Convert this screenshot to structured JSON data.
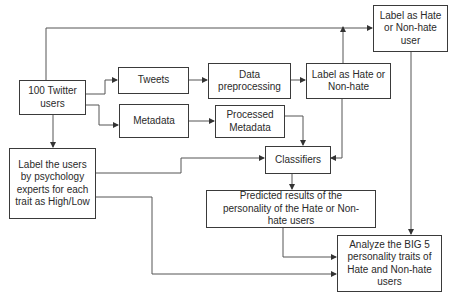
{
  "diagram": {
    "type": "flowchart",
    "nodes": {
      "twitter_users": "100 Twitter users",
      "tweets": "Tweets",
      "metadata": "Metadata",
      "data_preprocessing": "Data preprocessing",
      "processed_metadata": "Processed Metadata",
      "label_hate": "Label as Hate or Non-hate",
      "label_hate_user": "Label as Hate or Non-hate user",
      "psych_label": "Label the users by psychology experts for each trait as High/Low",
      "classifiers": "Classifiers",
      "predicted_results": "Predicted results of the personality of the Hate or Non-hate users",
      "analyze_big5": "Analyze the BIG 5 personality traits of Hate and Non-hate users"
    },
    "edges": [
      {
        "from": "twitter_users",
        "to": "tweets"
      },
      {
        "from": "twitter_users",
        "to": "metadata"
      },
      {
        "from": "twitter_users",
        "to": "label_hate_user"
      },
      {
        "from": "twitter_users",
        "to": "psych_label"
      },
      {
        "from": "tweets",
        "to": "data_preprocessing"
      },
      {
        "from": "data_preprocessing",
        "to": "label_hate"
      },
      {
        "from": "label_hate",
        "to": "label_hate_user"
      },
      {
        "from": "label_hate",
        "to": "classifiers"
      },
      {
        "from": "metadata",
        "to": "processed_metadata"
      },
      {
        "from": "processed_metadata",
        "to": "classifiers"
      },
      {
        "from": "psych_label",
        "to": "classifiers"
      },
      {
        "from": "psych_label",
        "to": "analyze_big5"
      },
      {
        "from": "classifiers",
        "to": "predicted_results"
      },
      {
        "from": "predicted_results",
        "to": "analyze_big5"
      },
      {
        "from": "label_hate_user",
        "to": "analyze_big5"
      }
    ],
    "colors": {
      "line": "#3a3a3a",
      "box_border": "#3a3a3a",
      "text": "#2a2a2a",
      "background": "#ffffff"
    }
  }
}
